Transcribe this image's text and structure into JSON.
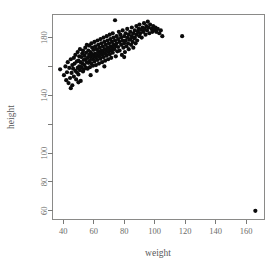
{
  "chart_data": {
    "type": "scatter",
    "title": "",
    "xlabel": "weight",
    "ylabel": "height",
    "xlim": [
      33,
      172
    ],
    "ylim": [
      54,
      196
    ],
    "xticks": [
      40,
      60,
      80,
      100,
      120,
      140,
      160
    ],
    "xtick_labels": [
      "40",
      "60",
      "80",
      "100",
      "120",
      "140",
      "160"
    ],
    "yticks": [
      60,
      80,
      100,
      120,
      140,
      160,
      180
    ],
    "ytick_labels": [
      "60",
      "80",
      "100",
      "",
      "140",
      "",
      "180"
    ],
    "grid": false,
    "legend": null,
    "marker": "filled-circle",
    "marker_color": "#0b0b0b",
    "marker_size": 3.0,
    "n_points": 199,
    "points": [
      [
        38.0,
        158.0
      ],
      [
        40.5,
        154.0
      ],
      [
        41.5,
        160.0
      ],
      [
        42.0,
        150.5
      ],
      [
        42.5,
        156.0
      ],
      [
        43.0,
        163.0
      ],
      [
        43.5,
        148.5
      ],
      [
        44.0,
        159.0
      ],
      [
        44.5,
        152.0
      ],
      [
        45.0,
        165.0
      ],
      [
        45.5,
        155.5
      ],
      [
        46.0,
        161.0
      ],
      [
        46.0,
        147.0
      ],
      [
        46.5,
        158.5
      ],
      [
        47.0,
        166.0
      ],
      [
        47.0,
        153.0
      ],
      [
        47.5,
        162.0
      ],
      [
        48.0,
        157.0
      ],
      [
        48.0,
        168.0
      ],
      [
        48.5,
        151.0
      ],
      [
        49.0,
        163.5
      ],
      [
        49.0,
        156.0
      ],
      [
        49.5,
        170.0
      ],
      [
        49.5,
        159.0
      ],
      [
        50.0,
        164.0
      ],
      [
        50.0,
        154.5
      ],
      [
        50.5,
        167.0
      ],
      [
        50.5,
        160.0
      ],
      [
        51.0,
        157.5
      ],
      [
        51.0,
        172.0
      ],
      [
        51.5,
        163.0
      ],
      [
        51.5,
        150.0
      ],
      [
        52.0,
        166.5
      ],
      [
        52.0,
        159.5
      ],
      [
        52.5,
        169.0
      ],
      [
        52.5,
        162.0
      ],
      [
        53.0,
        156.5
      ],
      [
        53.0,
        171.0
      ],
      [
        53.5,
        164.5
      ],
      [
        53.5,
        158.0
      ],
      [
        54.0,
        167.5
      ],
      [
        54.0,
        161.0
      ],
      [
        54.5,
        173.0
      ],
      [
        54.5,
        165.0
      ],
      [
        55.0,
        159.0
      ],
      [
        55.0,
        169.5
      ],
      [
        55.5,
        163.0
      ],
      [
        55.5,
        175.0
      ],
      [
        56.0,
        166.0
      ],
      [
        56.0,
        158.5
      ],
      [
        56.5,
        171.0
      ],
      [
        56.5,
        162.5
      ],
      [
        57.0,
        168.0
      ],
      [
        57.0,
        174.5
      ],
      [
        57.5,
        164.0
      ],
      [
        57.5,
        159.5
      ],
      [
        58.0,
        170.0
      ],
      [
        58.0,
        166.5
      ],
      [
        58.5,
        176.0
      ],
      [
        58.5,
        162.0
      ],
      [
        59.0,
        168.5
      ],
      [
        59.0,
        173.0
      ],
      [
        59.5,
        165.0
      ],
      [
        59.5,
        160.5
      ],
      [
        60.0,
        171.5
      ],
      [
        60.0,
        167.0
      ],
      [
        60.5,
        177.0
      ],
      [
        60.5,
        163.5
      ],
      [
        61.0,
        169.0
      ],
      [
        61.0,
        174.0
      ],
      [
        61.5,
        166.0
      ],
      [
        61.5,
        161.0
      ],
      [
        62.0,
        172.0
      ],
      [
        62.0,
        168.0
      ],
      [
        62.5,
        178.0
      ],
      [
        62.5,
        164.5
      ],
      [
        63.0,
        170.5
      ],
      [
        63.0,
        175.0
      ],
      [
        63.5,
        167.0
      ],
      [
        63.5,
        162.0
      ],
      [
        64.0,
        173.0
      ],
      [
        64.0,
        169.0
      ],
      [
        64.5,
        179.0
      ],
      [
        64.5,
        165.5
      ],
      [
        65.0,
        171.0
      ],
      [
        65.0,
        176.0
      ],
      [
        65.5,
        168.0
      ],
      [
        65.5,
        163.0
      ],
      [
        66.0,
        174.0
      ],
      [
        66.0,
        170.0
      ],
      [
        66.5,
        180.0
      ],
      [
        66.5,
        166.5
      ],
      [
        67.0,
        172.0
      ],
      [
        67.0,
        177.0
      ],
      [
        67.5,
        169.0
      ],
      [
        67.5,
        164.0
      ],
      [
        68.0,
        175.0
      ],
      [
        68.0,
        171.0
      ],
      [
        68.5,
        181.0
      ],
      [
        68.5,
        167.5
      ],
      [
        69.0,
        173.0
      ],
      [
        69.0,
        178.0
      ],
      [
        69.5,
        170.0
      ],
      [
        69.5,
        165.0
      ],
      [
        70.0,
        176.0
      ],
      [
        70.0,
        172.0
      ],
      [
        70.5,
        182.0
      ],
      [
        70.5,
        168.5
      ],
      [
        71.0,
        174.0
      ],
      [
        71.0,
        179.0
      ],
      [
        71.5,
        171.0
      ],
      [
        71.5,
        166.0
      ],
      [
        72.0,
        177.0
      ],
      [
        72.0,
        173.0
      ],
      [
        72.5,
        183.0
      ],
      [
        72.5,
        169.5
      ],
      [
        73.0,
        175.0
      ],
      [
        73.0,
        180.0
      ],
      [
        73.5,
        172.0
      ],
      [
        74.0,
        178.0
      ],
      [
        74.0,
        192.0
      ],
      [
        74.5,
        174.0
      ],
      [
        75.0,
        181.0
      ],
      [
        75.0,
        176.0
      ],
      [
        75.5,
        170.5
      ],
      [
        76.0,
        179.0
      ],
      [
        76.0,
        173.5
      ],
      [
        76.5,
        184.0
      ],
      [
        77.0,
        177.0
      ],
      [
        77.0,
        171.0
      ],
      [
        77.5,
        182.0
      ],
      [
        78.0,
        175.0
      ],
      [
        78.0,
        180.0
      ],
      [
        78.5,
        168.0
      ],
      [
        79.0,
        178.0
      ],
      [
        79.0,
        185.0
      ],
      [
        79.5,
        173.0
      ],
      [
        80.0,
        181.0
      ],
      [
        80.0,
        176.0
      ],
      [
        80.5,
        170.0
      ],
      [
        81.0,
        183.0
      ],
      [
        81.0,
        178.0
      ],
      [
        81.5,
        174.0
      ],
      [
        82.0,
        186.0
      ],
      [
        82.0,
        180.0
      ],
      [
        82.5,
        176.0
      ],
      [
        83.0,
        182.0
      ],
      [
        83.0,
        172.0
      ],
      [
        83.5,
        178.5
      ],
      [
        84.0,
        184.0
      ],
      [
        84.0,
        179.0
      ],
      [
        84.5,
        175.0
      ],
      [
        85.0,
        187.0
      ],
      [
        85.0,
        181.0
      ],
      [
        85.5,
        177.0
      ],
      [
        86.0,
        183.0
      ],
      [
        86.0,
        173.0
      ],
      [
        86.5,
        179.5
      ],
      [
        87.0,
        185.0
      ],
      [
        87.0,
        180.0
      ],
      [
        87.5,
        176.0
      ],
      [
        88.0,
        188.0
      ],
      [
        88.0,
        182.0
      ],
      [
        88.5,
        178.0
      ],
      [
        89.0,
        184.0
      ],
      [
        89.5,
        186.0
      ],
      [
        90.0,
        181.0
      ],
      [
        90.0,
        189.0
      ],
      [
        90.5,
        183.0
      ],
      [
        91.0,
        185.5
      ],
      [
        91.5,
        180.0
      ],
      [
        92.0,
        187.0
      ],
      [
        92.5,
        184.0
      ],
      [
        93.0,
        190.0
      ],
      [
        93.5,
        186.0
      ],
      [
        94.0,
        182.0
      ],
      [
        94.5,
        188.0
      ],
      [
        95.0,
        185.0
      ],
      [
        95.5,
        191.0
      ],
      [
        96.0,
        187.0
      ],
      [
        96.5,
        183.0
      ],
      [
        97.0,
        189.0
      ],
      [
        98.0,
        186.0
      ],
      [
        98.5,
        184.0
      ],
      [
        99.0,
        188.0
      ],
      [
        100.0,
        185.5
      ],
      [
        100.5,
        187.0
      ],
      [
        101.0,
        184.0
      ],
      [
        102.0,
        186.0
      ],
      [
        103.0,
        183.0
      ],
      [
        104.0,
        185.0
      ],
      [
        105.0,
        181.0
      ],
      [
        74.5,
        167.0
      ],
      [
        80.0,
        166.5
      ],
      [
        67.0,
        160.0
      ],
      [
        58.0,
        154.0
      ],
      [
        62.0,
        157.0
      ],
      [
        50.0,
        149.0
      ],
      [
        45.0,
        145.0
      ],
      [
        118.0,
        181.0
      ],
      [
        166.0,
        60.0
      ]
    ],
    "outliers": [
      {
        "x": 118.0,
        "y": 181.0,
        "note": "isolated high-weight point"
      },
      {
        "x": 166.0,
        "y": 60.0,
        "note": "bottom-right extreme outlier"
      }
    ]
  },
  "figure": {
    "background_color": "#ffffff",
    "axis_color": "#7a7a78",
    "label_color": "#6d6d6b",
    "point_color": "#0b0b0b"
  }
}
